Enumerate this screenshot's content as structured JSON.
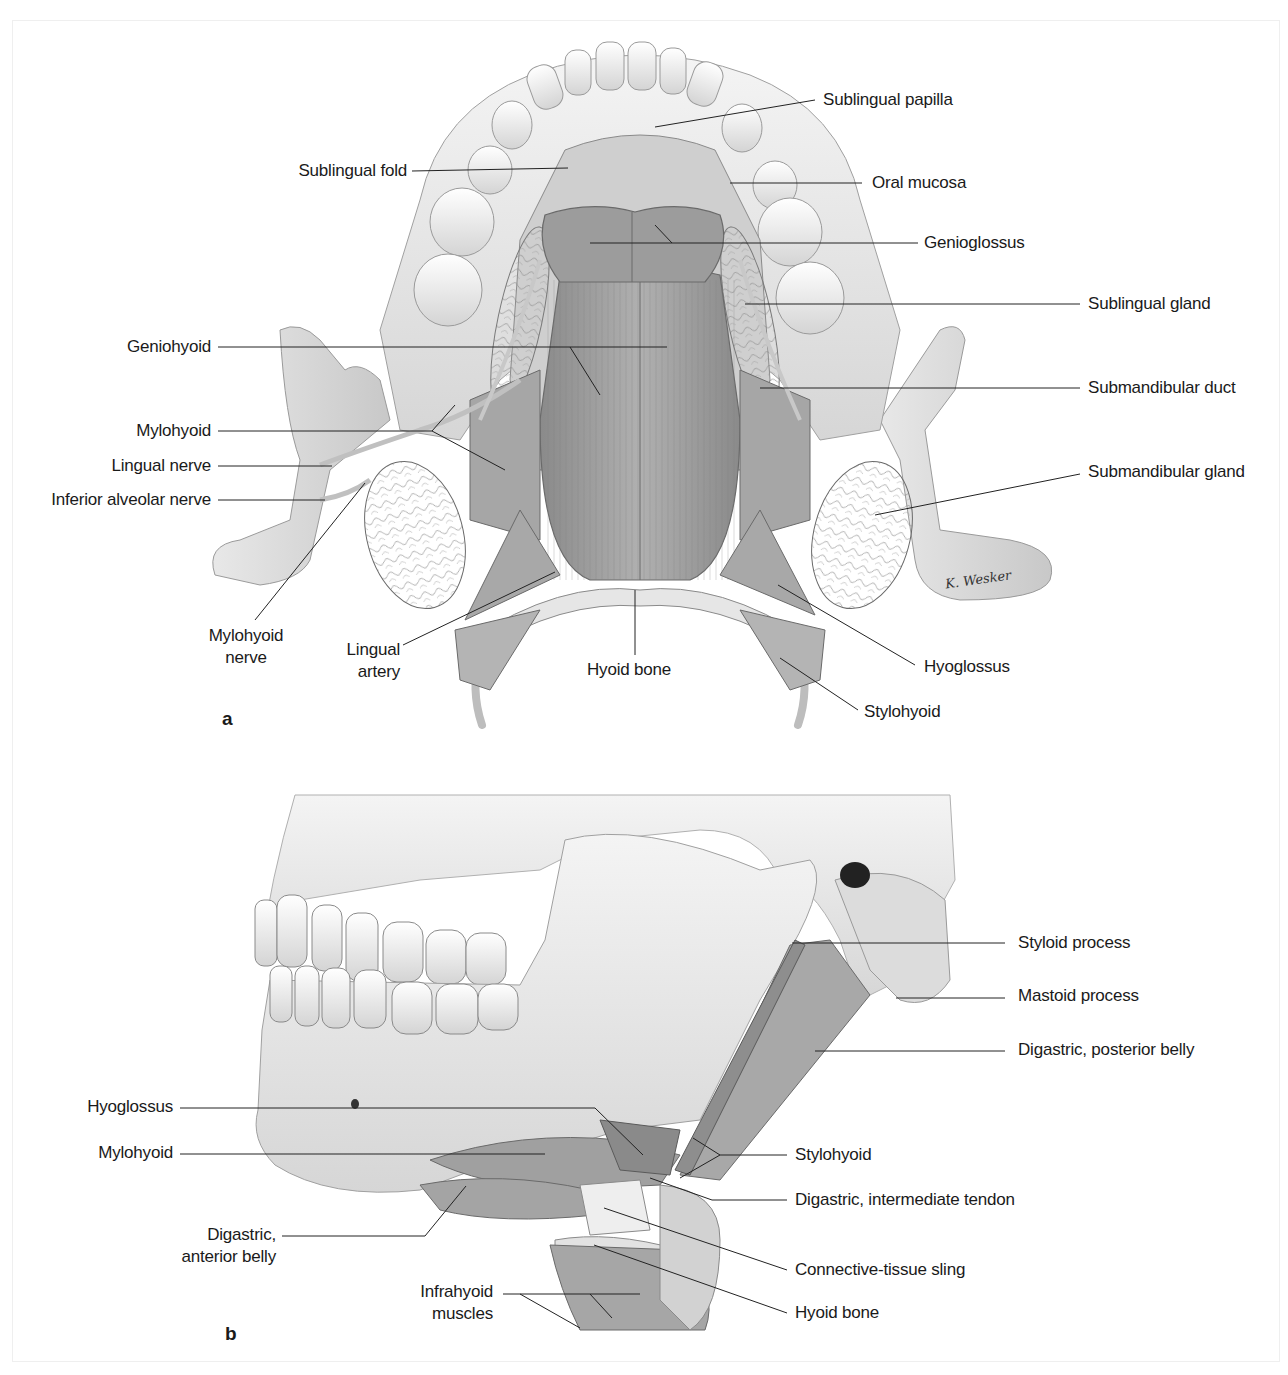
{
  "figure": {
    "panels": [
      {
        "id": "a",
        "letter": "a",
        "view": "Floor of the oral cavity, superior view",
        "labels": {
          "sublingual_papilla": "Sublingual papilla",
          "sublingual_fold": "Sublingual fold",
          "oral_mucosa": "Oral mucosa",
          "genioglossus": "Genioglossus",
          "sublingual_gland": "Sublingual gland",
          "geniohyoid": "Geniohyoid",
          "submandibular_duct": "Submandibular duct",
          "mylohyoid": "Mylohyoid",
          "lingual_nerve": "Lingual nerve",
          "inferior_alveolar_nerve": "Inferior alveolar nerve",
          "submandibular_gland": "Submandibular gland",
          "mylohyoid_nerve": [
            "Mylohyoid",
            "nerve"
          ],
          "lingual_artery": [
            "Lingual",
            "artery"
          ],
          "hyoid_bone": "Hyoid bone",
          "hyoglossus": "Hyoglossus",
          "stylohyoid": "Stylohyoid"
        },
        "signature": "K. Wesker"
      },
      {
        "id": "b",
        "letter": "b",
        "view": "Lateral view of skull, mandible and suprahyoid muscles",
        "labels": {
          "styloid_process": "Styloid process",
          "mastoid_process": "Mastoid process",
          "digastric_posterior_belly": "Digastric, posterior belly",
          "hyoglossus": "Hyoglossus",
          "mylohyoid": "Mylohyoid",
          "stylohyoid": "Stylohyoid",
          "digastric_intermediate_tendon": "Digastric, intermediate tendon",
          "digastric_anterior_belly": [
            "Digastric,",
            "anterior belly"
          ],
          "connective_tissue_sling": "Connective-tissue sling",
          "infrahyoid_muscles": [
            "Infrahyoid",
            "muscles"
          ],
          "hyoid_bone": "Hyoid bone"
        }
      }
    ]
  }
}
